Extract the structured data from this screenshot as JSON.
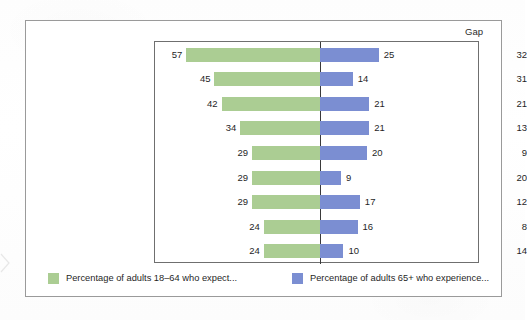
{
  "chart_data": {
    "type": "bar",
    "subtype": "tornado-diverging-bar",
    "title": "",
    "xlabel": "",
    "ylabel": "",
    "grid": false,
    "legend_position": "bottom",
    "axis_center": 0,
    "extra_column_header": "Gap",
    "categories": [
      "Memory loss",
      "Not able to drive",
      "A serious illness",
      "Not sexually active",
      "Feeling sad or depressed",
      "Not feeding needed",
      "Loneliness",
      "Trouble paying bills",
      "Being a burden"
    ],
    "series": [
      {
        "name": "Percentage of adults 18–64 who expect...",
        "color": "#abcd93",
        "direction": "left",
        "values": [
          57,
          45,
          42,
          34,
          29,
          29,
          29,
          24,
          24
        ]
      },
      {
        "name": "Percentage of adults 65+ who experience...",
        "color": "#7b8ed2",
        "direction": "right",
        "values": [
          25,
          14,
          21,
          21,
          20,
          9,
          17,
          16,
          10
        ]
      }
    ],
    "gap_values": [
      32,
      31,
      21,
      13,
      9,
      20,
      12,
      8,
      14
    ],
    "xlim": [
      -60,
      60
    ]
  },
  "legend": {
    "items": [
      {
        "label": "Percentage of adults 18–64 who expect...",
        "color": "#abcd93",
        "swatch": "green-swatch"
      },
      {
        "label": "Percentage of adults 65+ who experience...",
        "color": "#7b8ed2",
        "swatch": "blue-swatch"
      }
    ]
  },
  "colors": {
    "green": "#abcd93",
    "blue": "#7b8ed2",
    "axis": "#3a3a3a",
    "plot_border": "#6f6f6f",
    "frame_border": "#9a9a9a",
    "text": "#1f1f1f"
  }
}
